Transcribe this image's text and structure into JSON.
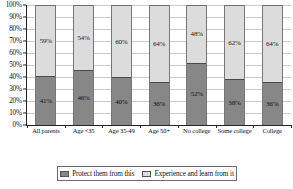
{
  "title_cut_off": "Parents of children under 18",
  "legend": {
    "position": "bottom",
    "items": [
      {
        "label": "Protect them from this",
        "color": "#878787",
        "icon": "legend-swatch"
      },
      {
        "label": "Experience and learn from it",
        "color": "#dcdcdc",
        "icon": "legend-swatch"
      }
    ]
  },
  "axis": {
    "y_ticks": [
      "0%",
      "10%",
      "20%",
      "30%",
      "40%",
      "50%",
      "60%",
      "70%",
      "80%",
      "90%",
      "100%"
    ]
  },
  "chart_data": {
    "type": "bar",
    "stacked": true,
    "title": "",
    "xlabel": "",
    "ylabel": "",
    "ylim": [
      0,
      100
    ],
    "ytick_step": 10,
    "grid": true,
    "legend_position": "bottom",
    "categories": [
      "All parents",
      "Age <35",
      "Age 35-49",
      "Age 50+",
      "No college",
      "Some college",
      "College"
    ],
    "series": [
      {
        "name": "Protect them from this",
        "color": "#878787",
        "values": [
          41,
          46,
          40,
          36,
          52,
          38,
          36
        ],
        "labels": [
          "41%",
          "46%",
          "40%",
          "36%",
          "52%",
          "38%",
          "36%"
        ]
      },
      {
        "name": "Experience and learn from it",
        "color": "#dcdcdc",
        "values": [
          59,
          54,
          60,
          64,
          48,
          62,
          64
        ],
        "labels": [
          "59%",
          "54%",
          "60%",
          "64%",
          "48%",
          "62%",
          "64%"
        ]
      }
    ]
  }
}
